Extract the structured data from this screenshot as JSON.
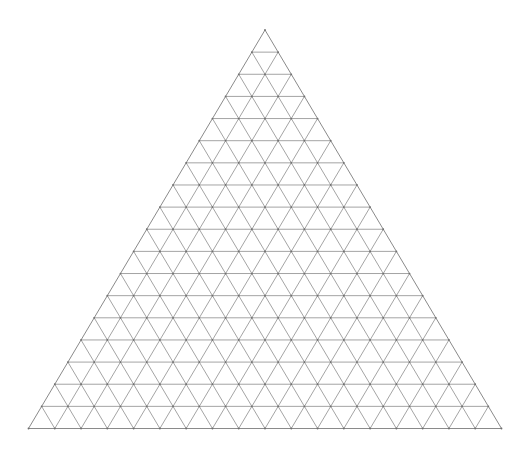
{
  "diagram": {
    "type": "ternary-triangular-grid",
    "divisions": 18,
    "apex": {
      "x": 265,
      "y": 30
    },
    "bottom_left": {
      "x": 28.5,
      "y": 428.5
    },
    "bottom_right": {
      "x": 501.5,
      "y": 428.5
    },
    "colors": {
      "background": "#ffffff",
      "line": "#9a9a9a",
      "outline": "#8a8a8a",
      "vertex": "#6e6e6e"
    },
    "labels": []
  }
}
